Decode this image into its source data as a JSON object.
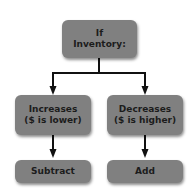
{
  "diagram": {
    "type": "decision-flowchart",
    "root": {
      "lines": [
        "If",
        "Inventory:"
      ]
    },
    "branches": [
      {
        "condition_lines": [
          "Increases",
          "($ is lower)"
        ],
        "action": "Subtract"
      },
      {
        "condition_lines": [
          "Decreases",
          "($ is higher)"
        ],
        "action": "Add"
      }
    ],
    "colors": {
      "box_fill": "#808080",
      "text": "#1c1c1c",
      "connector": "#111111",
      "background": "#ffffff"
    }
  }
}
